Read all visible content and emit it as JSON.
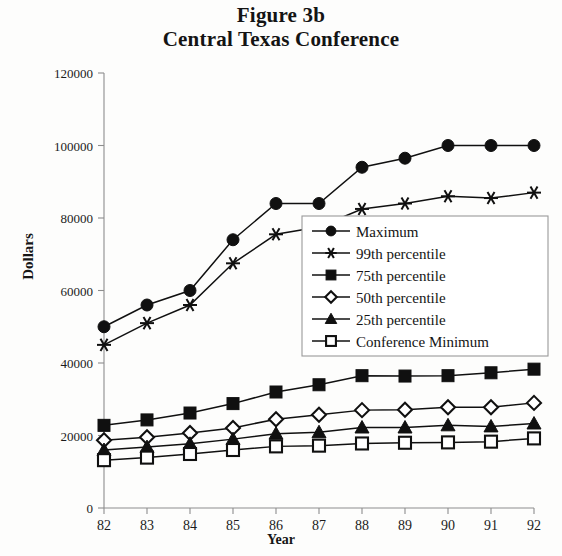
{
  "figure": {
    "title_line1": "Figure 3b",
    "title_line2": "Central Texas Conference"
  },
  "chart_data": {
    "type": "line",
    "xlabel": "Year",
    "ylabel": "Dollars",
    "categories": [
      "82",
      "83",
      "84",
      "85",
      "86",
      "87",
      "88",
      "89",
      "90",
      "91",
      "92"
    ],
    "x": [
      82,
      83,
      84,
      85,
      86,
      87,
      88,
      89,
      90,
      91,
      92
    ],
    "xlim": [
      82,
      92
    ],
    "ylim": [
      0,
      120000
    ],
    "yticks": [
      0,
      20000,
      40000,
      60000,
      80000,
      100000,
      120000
    ],
    "ytick_labels": [
      "0",
      "20000",
      "40000",
      "60000",
      "80000",
      "100000",
      "120000"
    ],
    "grid": false,
    "legend_position": "center-right",
    "series": [
      {
        "name": "Maximum",
        "marker": "filled-circle",
        "values": [
          50000,
          56000,
          60000,
          74000,
          84000,
          84000,
          94000,
          96500,
          100000,
          100000,
          100000
        ]
      },
      {
        "name": "99th percentile",
        "marker": "star",
        "values": [
          45000,
          51000,
          56000,
          67500,
          75500,
          77500,
          82500,
          84000,
          86000,
          85500,
          87000
        ]
      },
      {
        "name": "75th percentile",
        "marker": "filled-square",
        "values": [
          22800,
          24300,
          26200,
          28800,
          32000,
          34000,
          36500,
          36400,
          36500,
          37300,
          38300
        ]
      },
      {
        "name": "50th percentile",
        "marker": "open-diamond",
        "values": [
          18700,
          19500,
          20700,
          22100,
          24500,
          25700,
          27000,
          27100,
          27800,
          27800,
          29000
        ]
      },
      {
        "name": "25th percentile",
        "marker": "filled-triangle",
        "values": [
          16000,
          16800,
          17700,
          19000,
          20500,
          20900,
          22200,
          22200,
          22800,
          22500,
          23300
        ]
      },
      {
        "name": "Conference Minimum",
        "marker": "open-square",
        "values": [
          13200,
          13900,
          14900,
          16000,
          17000,
          17200,
          17800,
          18000,
          18100,
          18300,
          19200
        ]
      }
    ]
  },
  "colors": {
    "ink": "#101010",
    "axis": "#8d8d8d",
    "background": "#fdfdfc",
    "legend_border": "#9a9a9a"
  }
}
